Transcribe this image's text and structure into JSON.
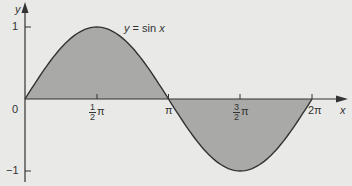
{
  "chart_data": {
    "type": "area",
    "title": "",
    "function_label": "y = sin x",
    "xlabel": "x",
    "ylabel": "y",
    "x_ticks": [
      {
        "value": 0,
        "label": "0"
      },
      {
        "value": 1.5708,
        "label": "½π"
      },
      {
        "value": 3.1416,
        "label": "π"
      },
      {
        "value": 4.7124,
        "label": "3/2π"
      },
      {
        "value": 6.2832,
        "label": "2π"
      }
    ],
    "y_ticks": [
      {
        "value": 1,
        "label": "1"
      },
      {
        "value": 0,
        "label": "0"
      },
      {
        "value": -1,
        "label": "−1"
      }
    ],
    "xlim": [
      0,
      6.2832
    ],
    "ylim": [
      -1,
      1
    ],
    "grid": false,
    "series": [
      {
        "name": "y = sin x",
        "x": [
          0,
          0.7854,
          1.5708,
          2.3562,
          3.1416,
          3.927,
          4.7124,
          5.4978,
          6.2832
        ],
        "values": [
          0,
          0.707,
          1,
          0.707,
          0,
          -0.707,
          -1,
          -0.707,
          0
        ],
        "fill": "area between curve and x-axis shaded"
      }
    ],
    "colors": {
      "fill": "#a9a9a7",
      "curve": "#333333",
      "axes": "#333333",
      "background": "#e9e9e7"
    }
  },
  "labels": {
    "y_axis": "y",
    "x_axis": "x",
    "y_one": "1",
    "y_zero": "0",
    "y_minus_one": "−1",
    "x_half_pi_num": "1",
    "x_half_pi_den": "2",
    "x_pi_symbol": "π",
    "x_pi": "π",
    "x_three_half_pi_num": "3",
    "x_three_half_pi_den": "2",
    "x_two_pi": "2π",
    "curve_y": "y",
    "curve_eq": " = sin ",
    "curve_x": "x"
  }
}
